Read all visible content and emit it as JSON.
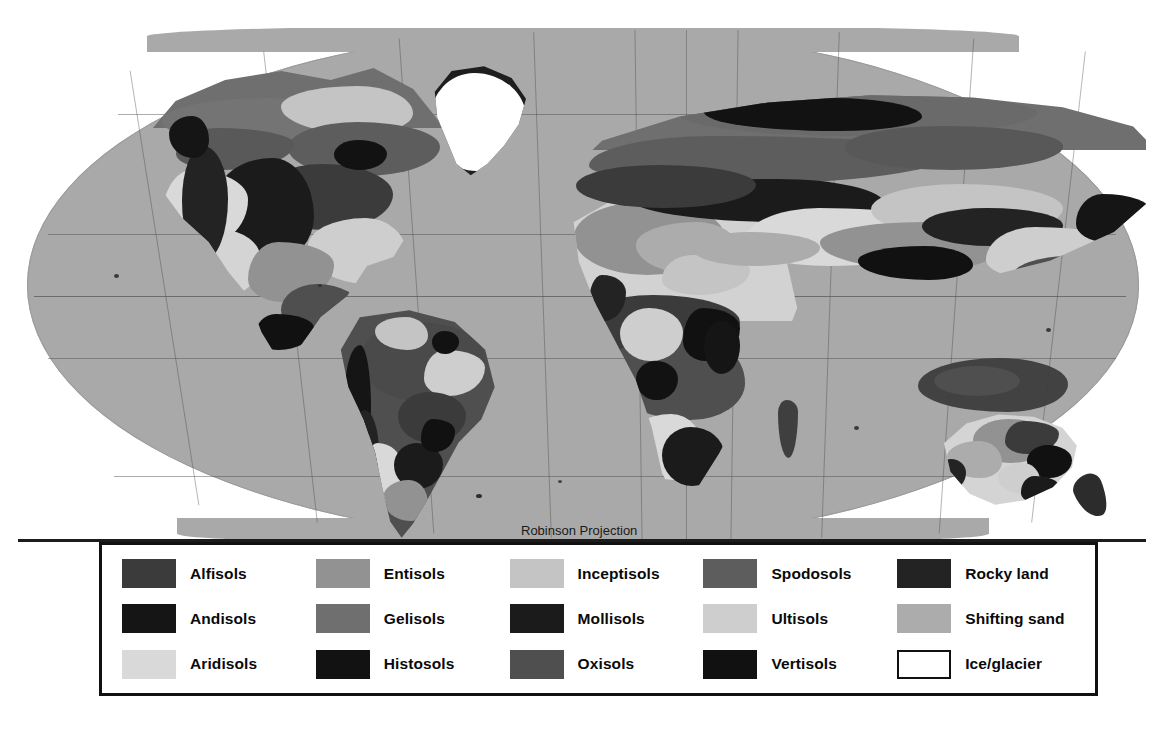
{
  "map": {
    "title": "World Soil Orders Map",
    "projection_note": "Robinson Projection",
    "scale_note": "Scale 1:130,000,000",
    "ocean_color": "#a9a9a9",
    "background_color": "#ffffff",
    "graticule_color": "#464646",
    "parallels": [
      "Arctic Circle",
      "Tropic of Cancer",
      "Equator",
      "Tropic of Capricorn",
      "Antarctic Circle"
    ]
  },
  "legend": {
    "border_color": "#111111",
    "background": "#ffffff",
    "columns": 5,
    "rows": 3,
    "items": [
      {
        "label": "Alfisols",
        "color": "#3b3b3b",
        "outlined": false
      },
      {
        "label": "Entisols",
        "color": "#929292",
        "outlined": false
      },
      {
        "label": "Inceptisols",
        "color": "#c4c4c4",
        "outlined": false
      },
      {
        "label": "Spodosols",
        "color": "#5d5d5d",
        "outlined": false
      },
      {
        "label": "Rocky land",
        "color": "#232323",
        "outlined": false
      },
      {
        "label": "Andisols",
        "color": "#151515",
        "outlined": false
      },
      {
        "label": "Gelisols",
        "color": "#6f6f6f",
        "outlined": false
      },
      {
        "label": "Mollisols",
        "color": "#1b1b1b",
        "outlined": false
      },
      {
        "label": "Ultisols",
        "color": "#cecece",
        "outlined": false
      },
      {
        "label": "Shifting sand",
        "color": "#acacac",
        "outlined": false
      },
      {
        "label": "Aridisols",
        "color": "#d9d9d9",
        "outlined": false
      },
      {
        "label": "Histosols",
        "color": "#121212",
        "outlined": false
      },
      {
        "label": "Oxisols",
        "color": "#4f4f4f",
        "outlined": false
      },
      {
        "label": "Vertisols",
        "color": "#111111",
        "outlined": false
      },
      {
        "label": "Ice/glacier",
        "color": "#ffffff",
        "outlined": true
      }
    ]
  }
}
